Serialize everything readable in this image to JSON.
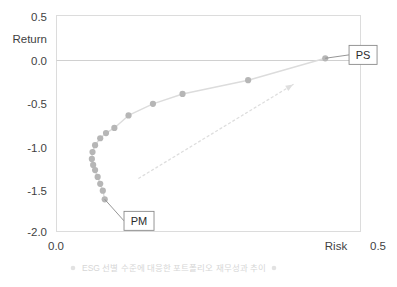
{
  "chart_data": {
    "type": "scatter",
    "title": "",
    "xlabel": "Risk",
    "ylabel": "Return",
    "xlim": [
      0.0,
      0.5
    ],
    "ylim": [
      -2.0,
      0.5
    ],
    "xticks": [
      "0.0",
      "0.5"
    ],
    "yticks": [
      "0.5",
      "0.0",
      "-0.5",
      "-1.0",
      "-1.5",
      "-2.0"
    ],
    "grid": false,
    "zero_line": true,
    "legend_position": "bottom",
    "legend": [
      "ESG 선별 수준에 대응한 포트폴리오 재무성과 추이"
    ],
    "series": [
      {
        "name": "ESG 선별 수준에 대응한 포트폴리오 재무성과 추이",
        "marker_color": "#b6b6b6",
        "line_color": "#dcdcdc",
        "points": [
          {
            "x": 0.075,
            "y": -1.62
          },
          {
            "x": 0.072,
            "y": -1.52
          },
          {
            "x": 0.068,
            "y": -1.44
          },
          {
            "x": 0.064,
            "y": -1.36
          },
          {
            "x": 0.06,
            "y": -1.28
          },
          {
            "x": 0.057,
            "y": -1.22
          },
          {
            "x": 0.055,
            "y": -1.15
          },
          {
            "x": 0.056,
            "y": -1.07
          },
          {
            "x": 0.06,
            "y": -0.99
          },
          {
            "x": 0.068,
            "y": -0.91
          },
          {
            "x": 0.077,
            "y": -0.85
          },
          {
            "x": 0.09,
            "y": -0.79
          },
          {
            "x": 0.112,
            "y": -0.645
          },
          {
            "x": 0.15,
            "y": -0.51
          },
          {
            "x": 0.196,
            "y": -0.395
          },
          {
            "x": 0.298,
            "y": -0.235
          },
          {
            "x": 0.418,
            "y": 0.02
          }
        ]
      }
    ],
    "annotations": [
      {
        "label": "PM",
        "point_x": 0.075,
        "point_y": -1.62,
        "box_x": 0.105,
        "box_y": -1.76
      },
      {
        "label": "PS",
        "point_x": 0.418,
        "point_y": 0.02,
        "box_x": 0.455,
        "box_y": 0.17
      }
    ],
    "arrow": {
      "style": "dotted",
      "color": "#dedede",
      "from": {
        "x": 0.128,
        "y": -1.375
      },
      "to": {
        "x": 0.368,
        "y": -0.285
      }
    }
  },
  "axes": {
    "y_label": "Return",
    "x_label": "Risk",
    "y_ticks": [
      "0.5",
      "0.0",
      "-0.5",
      "-1.0",
      "-1.5",
      "-2.0"
    ],
    "x_ticks": [
      "0.0",
      "0.5"
    ]
  },
  "labels": {
    "pm": "PM",
    "ps": "PS"
  },
  "legend": {
    "items": [
      {
        "marker": "dot-marker",
        "text": "ESG 선별 수준에 대응한 포트폴리오 재무성과 추이"
      }
    ]
  },
  "colors": {
    "marker": "#b6b6b6",
    "line": "#dcdcdc",
    "frame": "#dcdcdc",
    "zero_line": "#d0d0d0",
    "text": "#3f3f3f",
    "legend_text": "#d6d6d6",
    "callout_border": "#8a8a8a"
  }
}
